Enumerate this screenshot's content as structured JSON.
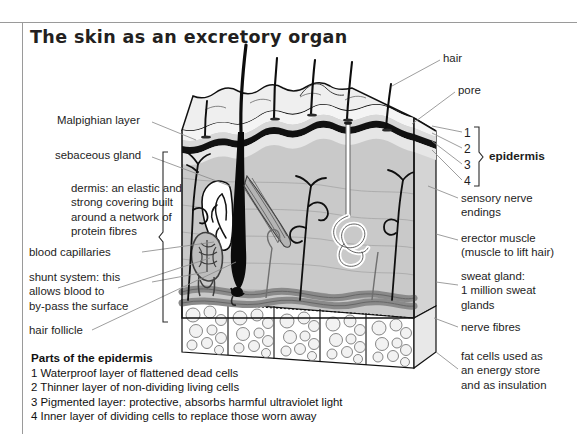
{
  "page": {
    "title": "The skin as an excretory organ",
    "background": "#ffffff",
    "rule_color": "#9a9a9a"
  },
  "labels_left": [
    {
      "id": "malpighian-layer",
      "text": "Malpighian layer",
      "x": 57,
      "y": 120
    },
    {
      "id": "sebaceous-gland",
      "text": "sebaceous gland",
      "x": 55,
      "y": 155
    },
    {
      "id": "dermis",
      "text": "dermis: an elastic and\nstrong covering built\naround a network of\nprotein fibres",
      "x": 71,
      "y": 188
    },
    {
      "id": "blood-capillaries",
      "text": "blood capillaries",
      "x": 29,
      "y": 252
    },
    {
      "id": "shunt-system",
      "text": "shunt system: this\nallows blood to\nby-pass the surface",
      "x": 29,
      "y": 277
    },
    {
      "id": "hair-follicle",
      "text": "hair follicle",
      "x": 29,
      "y": 330
    }
  ],
  "labels_right": [
    {
      "id": "hair",
      "text": "hair",
      "x": 443,
      "y": 57
    },
    {
      "id": "pore",
      "text": "pore",
      "x": 458,
      "y": 89
    },
    {
      "id": "epidermis",
      "text": "epidermis",
      "x": 480,
      "y": 155,
      "bold": true
    },
    {
      "id": "sensory-nerve-endings",
      "text": "sensory nerve\nendings",
      "x": 461,
      "y": 197
    },
    {
      "id": "erector-muscle",
      "text": "erector muscle\n(muscle to lift hair)",
      "x": 461,
      "y": 237
    },
    {
      "id": "sweat-gland",
      "text": "sweat gland:\n1 million sweat\nglands",
      "x": 461,
      "y": 275
    },
    {
      "id": "nerve-fibres",
      "text": "nerve fibres",
      "x": 461,
      "y": 326
    },
    {
      "id": "fat-cells",
      "text": "fat cells used as\nan energy store\nand as insulation",
      "x": 461,
      "y": 355
    }
  ],
  "epidermis_numbers": [
    {
      "label": "1",
      "x": 466,
      "y": 133
    },
    {
      "label": "2",
      "x": 466,
      "y": 149
    },
    {
      "label": "3",
      "x": 466,
      "y": 165
    },
    {
      "label": "4",
      "x": 466,
      "y": 181
    }
  ],
  "legend": {
    "heading": "Parts of the epidermis",
    "items": [
      "1 Waterproof layer of flattened dead cells",
      "2 Thinner layer of non-dividing living cells",
      "3 Pigmented layer: protective, absorbs harmful ultraviolet light",
      "4 Inner layer of dividing cells to replace those worn away"
    ]
  },
  "diagram": {
    "name": "skin-cross-section-diagram",
    "colors": {
      "dermis_fill": "#c9c9c9",
      "epidermis_fill": "#e2e2e2",
      "surface_fill": "#ededed",
      "malpighian_line": "#111111",
      "blood_vessel": "#7d7d7d",
      "nerve": "#1a1a1a",
      "fat_cell": "#efefef",
      "outline": "#111111"
    }
  }
}
